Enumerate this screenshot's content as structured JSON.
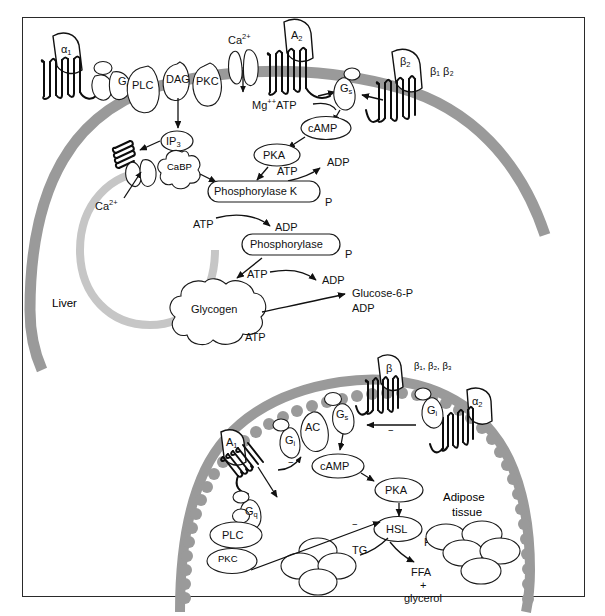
{
  "figure": {
    "caption": ""
  },
  "colors": {
    "plasma_membrane": "#9a9a9a",
    "er_membrane": "#c6c6c6",
    "outline": "#111111",
    "background": "#ffffff",
    "frame_border": "#2a2a2a"
  },
  "liver_cell": {
    "tissue_label": "Liver",
    "receptors": [
      {
        "name": "alpha1-receptor",
        "label": "α",
        "subscript": "1"
      },
      {
        "name": "A2-receptor",
        "label": "A",
        "subscript": "2"
      },
      {
        "name": "beta2-receptor",
        "label": "β",
        "subscript": "2"
      }
    ],
    "receptor_family_label": "β₁ β₂",
    "channel_label": "Ca",
    "channel_sup": "2+",
    "g_proteins": [
      {
        "name": "Gq-protein",
        "label": "G",
        "subscript": "q"
      },
      {
        "name": "Gs-protein",
        "label": "G",
        "subscript": "s"
      }
    ],
    "effectors": [
      {
        "name": "PLC-enzyme",
        "label": "PLC"
      },
      {
        "name": "DAG-messenger",
        "label": "DAG"
      },
      {
        "name": "PKC-enzyme",
        "label": "PKC"
      },
      {
        "name": "IP3-messenger",
        "label": "IP",
        "subscript": "3"
      },
      {
        "name": "CaBP-protein",
        "label": "CaBP"
      },
      {
        "name": "PKA-enzyme",
        "label": "PKA"
      },
      {
        "name": "cAMP-messenger",
        "label": "cAMP"
      },
      {
        "name": "phosphorylase-k-enzyme",
        "label": "Phosphorylase K"
      },
      {
        "name": "phosphorylase-enzyme",
        "label": "Phosphorylase"
      },
      {
        "name": "glycogen-store",
        "label": "Glycogen"
      }
    ],
    "substrates": {
      "mg_atp": "Mg",
      "mg_atp_sup": "++",
      "mg_atp_rest": "ATP",
      "atp": "ATP",
      "adp": "ADP",
      "phosphate": "P",
      "ca_ion": "Ca",
      "ca_ion_sup": "2+",
      "glucose6p": "Glucose-6-P"
    }
  },
  "adipose_cell": {
    "tissue_label_line1": "Adipose",
    "tissue_label_line2": "tissue",
    "receptors": [
      {
        "name": "beta-receptor",
        "label": "β",
        "subscript": ""
      },
      {
        "name": "alpha2-receptor",
        "label": "α",
        "subscript": "2"
      },
      {
        "name": "A1-receptor",
        "label": "A",
        "subscript": "1"
      }
    ],
    "receptor_family_label": "β₁, β₂, β₃",
    "g_proteins": [
      {
        "name": "Gs-protein",
        "label": "G",
        "subscript": "s"
      },
      {
        "name": "Gi-protein-right",
        "label": "G",
        "subscript": "i"
      },
      {
        "name": "Gi-protein-left",
        "label": "G",
        "subscript": "i"
      },
      {
        "name": "Gq-protein",
        "label": "G",
        "subscript": "q"
      }
    ],
    "effectors": [
      {
        "name": "adenylyl-cyclase",
        "label": "AC"
      },
      {
        "name": "cAMP-messenger",
        "label": "cAMP"
      },
      {
        "name": "PKA-enzyme",
        "label": "PKA"
      },
      {
        "name": "HSL-enzyme",
        "label": "HSL"
      },
      {
        "name": "PLC-enzyme",
        "label": "PLC"
      },
      {
        "name": "PKC-enzyme",
        "label": "PKC"
      },
      {
        "name": "TG-store",
        "label": "TG"
      }
    ],
    "products": {
      "ffa": "FFA",
      "plus": "+",
      "glycerol": "glycerol",
      "phosphate": "P"
    },
    "inhibition_sign": "−"
  }
}
